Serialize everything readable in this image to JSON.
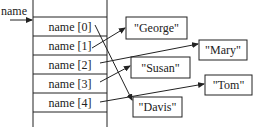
{
  "variable_label": "name",
  "rows": [
    {
      "label": "name [0]",
      "target": 4
    },
    {
      "label": "name [1]",
      "target": 0
    },
    {
      "label": "name [2]",
      "target": 1
    },
    {
      "label": "name [3]",
      "target": 2
    },
    {
      "label": "name [4]",
      "target": 3
    }
  ],
  "strings": [
    "\"George\"",
    "\"Mary\"",
    "\"Susan\"",
    "\"Tom\"",
    "\"Davis\""
  ],
  "colors": {
    "stroke": "#222222",
    "background": "#ffffff"
  }
}
